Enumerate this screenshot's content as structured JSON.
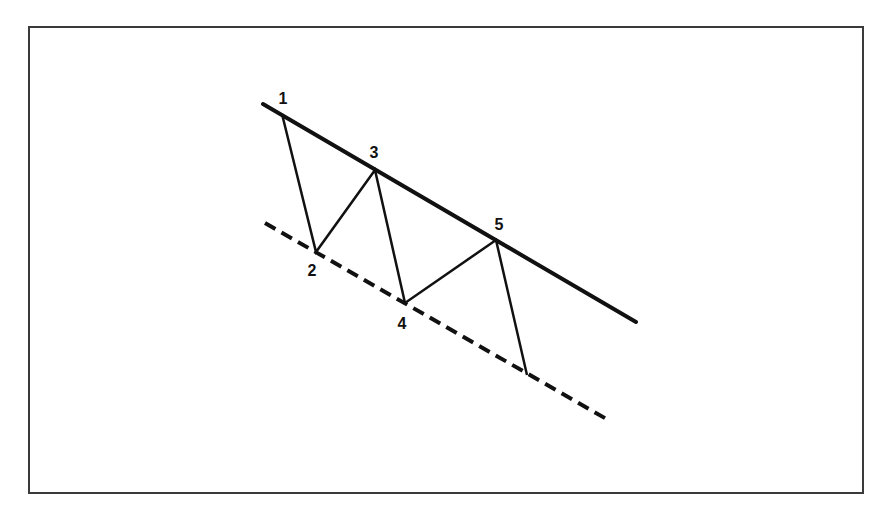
{
  "diagram": {
    "type": "descending-channel-wave-pattern",
    "colors": {
      "line": "#111111",
      "frame": "#3a3a3a",
      "background": "#ffffff"
    },
    "resistance_line": {
      "style": "solid",
      "from": [
        263,
        104
      ],
      "to": [
        636,
        322
      ]
    },
    "support_line": {
      "style": "dashed",
      "from": [
        265,
        223
      ],
      "to": [
        610,
        421
      ]
    },
    "wave_points": [
      {
        "label": "1",
        "x": 282,
        "y": 114,
        "label_x": 283,
        "label_y": 104
      },
      {
        "label": "2",
        "x": 316,
        "y": 252,
        "label_x": 312,
        "label_y": 276
      },
      {
        "label": "3",
        "x": 375,
        "y": 170,
        "label_x": 374,
        "label_y": 158
      },
      {
        "label": "4",
        "x": 405,
        "y": 303,
        "label_x": 402,
        "label_y": 329
      },
      {
        "label": "5",
        "x": 496,
        "y": 240,
        "label_x": 499,
        "label_y": 230
      },
      {
        "label": "",
        "x": 527,
        "y": 375
      }
    ]
  }
}
